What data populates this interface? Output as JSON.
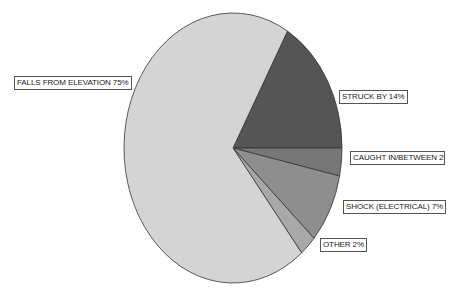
{
  "chart_data": {
    "type": "pie",
    "title": "",
    "categories": [
      "FALLS FROM ELEVATION",
      "STRUCK BY",
      "CAUGHT IN/BETWEEN",
      "SHOCK (ELECTRICAL)",
      "OTHER"
    ],
    "values": [
      75,
      14,
      2,
      7,
      2
    ],
    "unit": "%",
    "legend": "none (direct boxed labels)",
    "note": "values are the labeled percentages; the slices in the source image are not drawn proportionally to them"
  },
  "drawn_angles": {
    "note": "wedge boundaries as measured from the screenshot pixels, in degrees clockwise from 12 o'clock; used only for rendering, not data",
    "boundaries_deg": [
      0,
      30,
      90,
      102,
      132,
      141
    ]
  },
  "labels": [
    {
      "text": "FALLS FROM ELEVATION 75%",
      "color": "#d4d4d4"
    },
    {
      "text": "STRUCK BY 14%",
      "color": "#555555"
    },
    {
      "text": "CAUGHT IN/BETWEEN 2%",
      "color": "#777777"
    },
    {
      "text": "SHOCK (ELECTRICAL) 7%",
      "color": "#8e8e8e"
    },
    {
      "text": "OTHER 2%",
      "color": "#a8a8a8"
    }
  ]
}
